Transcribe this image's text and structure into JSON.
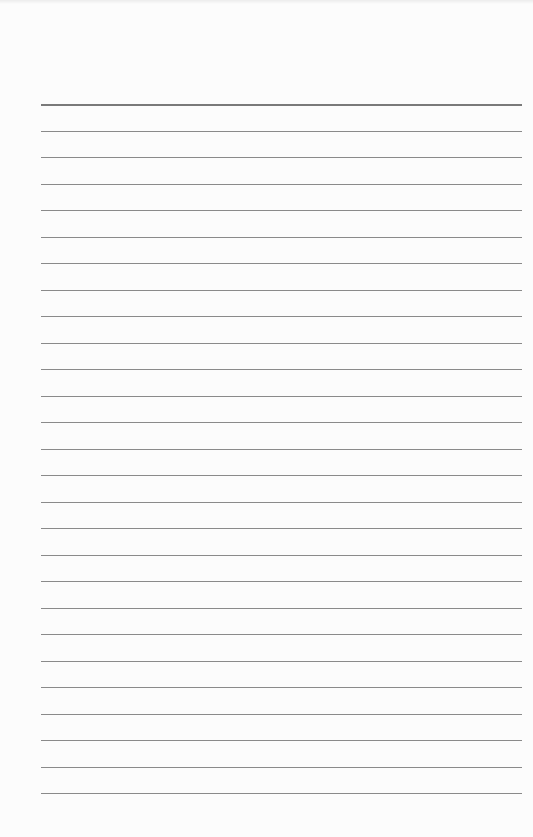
{
  "sheet": {
    "type": "lined-paper",
    "line_count": 27,
    "first_line_y": 104,
    "line_spacing": 26.5,
    "line_left": 41,
    "line_width": 481,
    "line_color": "#8a8a8a",
    "header_line_color": "#7a7a7a",
    "paper_color": "#fcfcfc"
  }
}
